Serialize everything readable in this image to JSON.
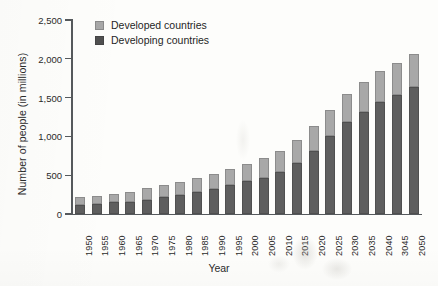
{
  "chart_data": {
    "type": "bar",
    "subtype": "stacked-vertical-bar",
    "title": "",
    "xlabel": "Year",
    "ylabel": "Number of people (in millions)",
    "ylim": [
      0,
      2500
    ],
    "yticks": [
      0,
      500,
      1000,
      1500,
      2000,
      2500
    ],
    "ytick_labels": [
      "0",
      "500",
      "1,000",
      "1,500",
      "2,000",
      "2,500"
    ],
    "grid": false,
    "legend_position": "top-left inside plot",
    "categories": [
      "1950",
      "1955",
      "1960",
      "1965",
      "1970",
      "1975",
      "1980",
      "1985",
      "1990",
      "1995",
      "2000",
      "2005",
      "2010",
      "2015",
      "2020",
      "2025",
      "2030",
      "2035",
      "2040",
      "3045",
      "2050"
    ],
    "series": [
      {
        "name": "Developing countries",
        "color": "#5e5e5e",
        "stack_position": "bottom",
        "values": [
          120,
          135,
          150,
          160,
          185,
          215,
          245,
          285,
          325,
          370,
          420,
          470,
          545,
          660,
          810,
          1000,
          1180,
          1310,
          1440,
          1540,
          1640
        ]
      },
      {
        "name": "Developed countries",
        "color": "#a8a8a8",
        "stack_position": "top",
        "values": [
          95,
          100,
          105,
          125,
          145,
          155,
          165,
          175,
          195,
          215,
          230,
          250,
          270,
          300,
          320,
          345,
          370,
          390,
          400,
          410,
          420
        ]
      }
    ],
    "totals": [
      215,
      235,
      255,
      285,
      330,
      370,
      410,
      460,
      520,
      585,
      650,
      720,
      815,
      960,
      1130,
      1345,
      1550,
      1700,
      1840,
      1950,
      2060
    ]
  },
  "legend": {
    "items": [
      {
        "label": "Developed countries",
        "swatch": "developed"
      },
      {
        "label": "Developing countries",
        "swatch": "developing"
      }
    ]
  },
  "axes": {
    "y_title": "Number of people (in millions)",
    "x_title": "Year"
  }
}
